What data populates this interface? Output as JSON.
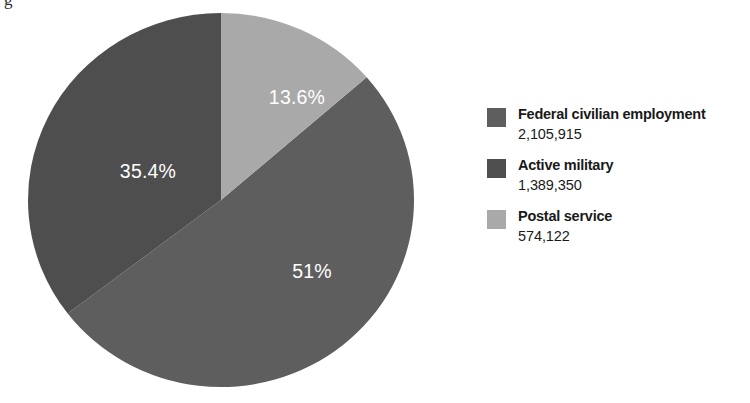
{
  "artifact": {
    "clipped_glyph": "g"
  },
  "chart_data": {
    "type": "pie",
    "title": "",
    "subtitle": "",
    "xlabel": "",
    "ylabel": "",
    "grid": false,
    "legend_position": "right",
    "total": 4069387,
    "start_angle_deg": 0,
    "direction": "clockwise",
    "categories": [
      "Federal civilian employment",
      "Active military",
      "Postal service"
    ],
    "values": [
      2105915,
      1389350,
      574122
    ],
    "percentages": [
      51.0,
      35.4,
      13.6
    ],
    "colors": [
      "#5e5e5e",
      "#4e4e4e",
      "#a9a9a9"
    ],
    "slices": [
      {
        "name": "Federal civilian employment",
        "value": "2,105,915",
        "value_number": 2105915,
        "percent_label": "51%",
        "percent": 51.0,
        "color": "#5e5e5e",
        "start_deg": 49.0,
        "end_deg": 232.6,
        "label_x": 288,
        "label_y": 270
      },
      {
        "name": "Active military",
        "value": "1,389,350",
        "value_number": 1389350,
        "percent_label": "35.4%",
        "percent": 35.4,
        "color": "#4e4e4e",
        "start_deg": 232.6,
        "end_deg": 360.0,
        "label_x": 124,
        "label_y": 170
      },
      {
        "name": "Postal service",
        "value": "574,122",
        "value_number": 574122,
        "percent_label": "13.6%",
        "percent": 13.6,
        "color": "#a9a9a9",
        "start_deg": 0.0,
        "end_deg": 49.0,
        "label_x": 273,
        "label_y": 96
      }
    ],
    "annotations": [
      "13.6%",
      "35.4%",
      "51%"
    ]
  },
  "legend": {
    "items": [
      {
        "label": "Federal civilian employment",
        "value": "2,105,915",
        "color": "#5e5e5e"
      },
      {
        "label": "Active military",
        "value": "1,389,350",
        "color": "#4e4e4e"
      },
      {
        "label": "Postal service",
        "value": "574,122",
        "color": "#a9a9a9"
      }
    ]
  }
}
